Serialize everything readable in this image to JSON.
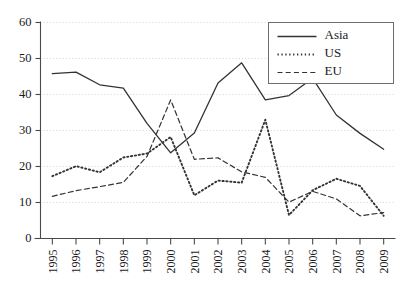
{
  "chart_data": {
    "type": "line",
    "title": "",
    "subtitle": "",
    "xlabel": "",
    "ylabel": "",
    "x": [
      "1995",
      "1996",
      "1997",
      "1998",
      "1999",
      "2000",
      "2001",
      "2002",
      "2003",
      "2004",
      "2005",
      "2006",
      "2007",
      "2008",
      "2009"
    ],
    "categories": [
      "1995",
      "1996",
      "1997",
      "1998",
      "1999",
      "2000",
      "2001",
      "2002",
      "2003",
      "2004",
      "2005",
      "2006",
      "2007",
      "2008",
      "2009"
    ],
    "series": [
      {
        "name": "Asia",
        "style": "solid",
        "color": "#333333",
        "values": [
          45.8,
          46.2,
          42.7,
          41.8,
          32.0,
          23.8,
          29.3,
          43.2,
          48.8,
          38.5,
          39.7,
          44.5,
          34.3,
          29.2,
          24.8
        ]
      },
      {
        "name": "US",
        "style": "dotted",
        "color": "#333333",
        "values": [
          17.3,
          20.1,
          18.4,
          22.5,
          23.6,
          28.2,
          12.0,
          16.1,
          15.5,
          33.0,
          6.5,
          13.4,
          16.6,
          14.6,
          6.3
        ]
      },
      {
        "name": "EU",
        "style": "dashed",
        "color": "#333333",
        "values": [
          11.7,
          13.3,
          14.4,
          15.6,
          22.8,
          38.5,
          22.0,
          22.4,
          18.5,
          17.0,
          10.1,
          13.1,
          11.0,
          6.3,
          7.2
        ]
      }
    ],
    "ylim": [
      0,
      60
    ],
    "yticks": [
      0,
      10,
      20,
      30,
      40,
      50,
      60
    ],
    "ytick_labels": [
      "0",
      "10",
      "20",
      "30",
      "40",
      "50",
      "60"
    ],
    "grid": true,
    "grid_axis": "y",
    "legend": {
      "position": "top-right",
      "entries": [
        {
          "label": "Asia",
          "style": "solid"
        },
        {
          "label": "US",
          "style": "dotted"
        },
        {
          "label": "EU",
          "style": "dashed"
        }
      ]
    },
    "xtick_rotation": 90
  },
  "colors": {
    "background": "#ffffff",
    "axis": "#4a4a4a",
    "grid": "#cfcfcf",
    "line": "#333333",
    "text": "#1a1a1a",
    "legend_border": "#6e6e6e"
  }
}
